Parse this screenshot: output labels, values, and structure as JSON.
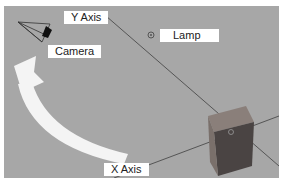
{
  "viewport": {
    "background": "#a7a7a7",
    "labels": {
      "y_axis": "Y Axis",
      "camera": "Camera",
      "lamp": "Lamp",
      "x_axis": "X Axis"
    },
    "objects": [
      "camera",
      "lamp",
      "cube"
    ],
    "icons": {
      "camera": "camera-icon",
      "lamp": "lamp-icon",
      "cube": "cube-mesh",
      "rotate_arrow": "rotate-arrow-icon"
    }
  }
}
